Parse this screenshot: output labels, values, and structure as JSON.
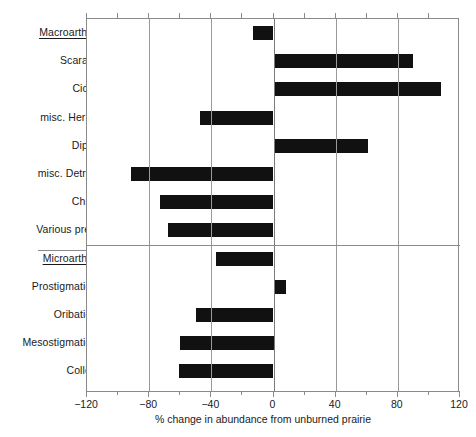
{
  "chart_data": {
    "type": "bar",
    "orientation": "horizontal",
    "title": "",
    "xlabel": "% change in abundance from unburned prairie",
    "ylabel": "",
    "xlim": [
      -120,
      120
    ],
    "xticks": [
      -120,
      -80,
      -40,
      0,
      40,
      80,
      120
    ],
    "xticklabels": [
      "−120",
      "−80",
      "−40",
      "0",
      "40",
      "80",
      "120"
    ],
    "minor_xticks": [
      -100,
      -60,
      -20,
      20,
      60,
      100
    ],
    "grid": "vertical",
    "legend": "none",
    "groups": [
      {
        "name": "Macroarthropods",
        "is_header": true,
        "categories": [
          "Macroarthropods",
          "Scarabeidae",
          "Cicadidae",
          "misc. Herbivores",
          "Diplopoda",
          "misc. Detritivores",
          "Chilopoda",
          "Various predators"
        ],
        "values": [
          -13,
          90,
          108,
          -47,
          61,
          -92,
          -73,
          -68
        ]
      },
      {
        "name": "Microarthropods",
        "is_header": true,
        "categories": [
          "Microarthropods",
          "Prostigmatid mites",
          "Oribatid mites",
          "Mesostigmatid mites",
          "Collembola"
        ],
        "values": [
          -37,
          8,
          -50,
          -60,
          -61
        ]
      }
    ],
    "categories": [
      "Macroarthropods",
      "Scarabeidae",
      "Cicadidae",
      "misc. Herbivores",
      "Diplopoda",
      "misc. Detritivores",
      "Chilopoda",
      "Various predators",
      "Microarthropods",
      "Prostigmatid mites",
      "Oribatid mites",
      "Mesostigmatid mites",
      "Collembola"
    ],
    "values": [
      -13,
      90,
      108,
      -47,
      61,
      -92,
      -73,
      -68,
      -37,
      8,
      -50,
      -60,
      -61
    ],
    "header_rows": [
      0,
      8
    ],
    "colors": {
      "bar": "#111111",
      "axis": "#8a8a8a",
      "grid": "#9a9a9a",
      "text": "#1a1a1a",
      "background": "#ffffff"
    }
  }
}
